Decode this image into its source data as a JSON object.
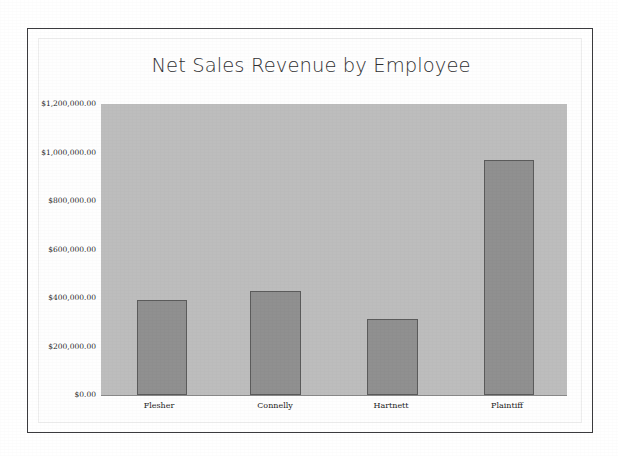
{
  "chart_data": {
    "type": "bar",
    "title": "Net Sales Revenue by Employee",
    "categories": [
      "Flesher",
      "Connelly",
      "Hartnett",
      "Plaintiff"
    ],
    "values": [
      392000,
      429000,
      313000,
      969000
    ],
    "xlabel": "",
    "ylabel": "",
    "ylim": [
      0,
      1200000
    ],
    "ytick_values": [
      0,
      200000,
      400000,
      600000,
      800000,
      1000000,
      1200000
    ],
    "ytick_labels": [
      "$0.00",
      "$200,000.00",
      "$400,000.00",
      "$600,000.00",
      "$800,000.00",
      "$1,000,000.00",
      "$1,200,000.00"
    ],
    "grid": false,
    "legend": false,
    "series_count": 1,
    "colors": {
      "bar_fill": "#909090",
      "bar_border": "#5b5b5b",
      "plot_background": "#bdbdbd",
      "title_text": "#2f2f31",
      "tick_text": "#2b2b2b",
      "frame_border": "#3b3b3e",
      "page_background": "#ffffff"
    }
  }
}
